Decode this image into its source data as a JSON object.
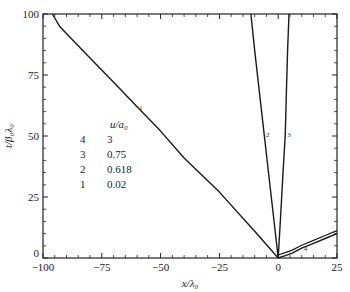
{
  "chart_data": {
    "type": "line",
    "title": "",
    "xlabel": "x/λ₀",
    "ylabel": "t/β₀λ₀",
    "xlim": [
      -100,
      25
    ],
    "ylim": [
      0,
      100
    ],
    "xticks": [
      -100,
      -75,
      -50,
      -25,
      0,
      25
    ],
    "yticks": [
      0,
      25,
      50,
      75,
      100
    ],
    "grid": false,
    "legend": {
      "title": "u/a₀",
      "position": "inside-left-lower",
      "entries": [
        {
          "id": "4",
          "label": "3"
        },
        {
          "id": "3",
          "label": "0.75"
        },
        {
          "id": "2",
          "label": "0.618"
        },
        {
          "id": "1",
          "label": "0.02"
        }
      ]
    },
    "series": [
      {
        "name": "1",
        "u_over_a0": 0.02,
        "x": [
          0,
          -10,
          -25,
          -40,
          -50,
          -60,
          -70,
          -80,
          -88,
          -93,
          -96
        ],
        "y": [
          0,
          11,
          27,
          41,
          52,
          62,
          72,
          82,
          90,
          95,
          100
        ]
      },
      {
        "name": "2",
        "u_over_a0": 0.618,
        "x": [
          0,
          -2,
          -4,
          -6,
          -8,
          -10,
          -11.6
        ],
        "y": [
          0,
          17,
          34,
          51,
          68,
          85,
          100
        ]
      },
      {
        "name": "3",
        "u_over_a0": 0.75,
        "x": [
          0,
          1,
          2,
          3,
          3.5,
          4,
          4.6
        ],
        "y": [
          0,
          17,
          34,
          51,
          68,
          85,
          100
        ]
      },
      {
        "name": "4",
        "u_over_a0": 3,
        "x": [
          0,
          3,
          6,
          10,
          15,
          20,
          25
        ],
        "y": [
          0,
          1,
          2,
          4,
          6,
          8,
          10
        ]
      }
    ]
  }
}
